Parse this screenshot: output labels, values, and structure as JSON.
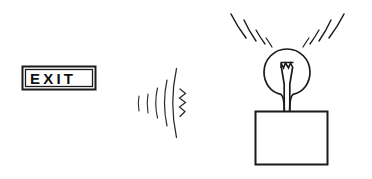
{
  "diagram": {
    "background_color": "#ffffff",
    "ink_color": "#1a1a1a",
    "exit_sign": {
      "label": "EXIT",
      "name": "exit-sign",
      "border_style": "double rectangle",
      "box": {
        "x": 22,
        "y": 66,
        "width": 74,
        "height": 24
      }
    },
    "signal_waves": {
      "name": "signal-waves",
      "direction": "rightward",
      "arc_count": 5,
      "has_squiggle": true,
      "squiggle_segments": 5,
      "origin": {
        "x": 138,
        "y": 103
      }
    },
    "light_bulb": {
      "name": "light-bulb",
      "glass_circle": {
        "cx": 287,
        "cy": 72,
        "r": 23
      },
      "filament": {
        "name": "filament-coil",
        "zigzag_peaks": 4
      },
      "lead_count": 2,
      "neck": {
        "top_y": 92,
        "bottom_y": 112
      }
    },
    "base_box": {
      "name": "base-box",
      "rect": {
        "x": 255,
        "y": 111,
        "width": 73,
        "height": 54
      }
    },
    "light_rays": {
      "name": "light-rays",
      "left_count": 4,
      "right_count": 4,
      "total_count": 8
    }
  }
}
